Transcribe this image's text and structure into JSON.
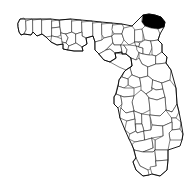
{
  "figure": {
    "type": "choropleth-locator-map",
    "title": "Map of Florida highlighting Nassau County",
    "caption": "",
    "background_color": "#ffffff",
    "width": 196,
    "height": 185
  },
  "map": {
    "region_name": "Florida",
    "subdivision_type": "county",
    "projection_note": "simple outline locator map",
    "boundary_color": "#1a1a1a",
    "outline_color": "#000000",
    "default_fill": "#ffffff",
    "highlight_fill": "#000000",
    "highlighted_count": 1,
    "total_subdivisions": 67
  },
  "highlight": {
    "name": "Nassau County",
    "position_description": "northeast corner, Atlantic coast at the Georgia border",
    "fill": "#000000",
    "bbox_px": [
      142,
      14,
      24,
      15
    ]
  },
  "legend": {
    "visible": false,
    "entries": [
      {
        "label": "Highlighted county",
        "color": "#000000"
      },
      {
        "label": "Other counties",
        "color": "#ffffff"
      }
    ]
  },
  "labels": {
    "visible": false,
    "items": []
  }
}
